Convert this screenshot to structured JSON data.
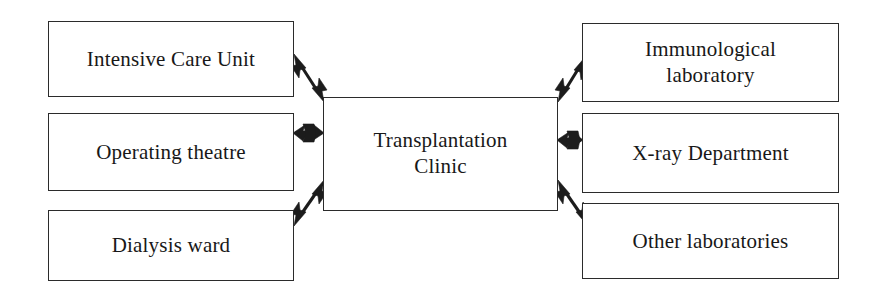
{
  "diagram": {
    "line_color": "#1c1c1c",
    "box_border_color": "#2b2b2b",
    "background_color": "#ffffff",
    "center_node": {
      "id": "transplantation-clinic",
      "label": "Transplantation\nClinic"
    },
    "left_nodes": [
      {
        "id": "intensive-care-unit",
        "label": "Intensive Care Unit"
      },
      {
        "id": "operating-theatre",
        "label": "Operating theatre"
      },
      {
        "id": "dialysis-ward",
        "label": "Dialysis ward"
      }
    ],
    "right_nodes": [
      {
        "id": "immunological-laboratory",
        "label": "Immunological\nlaboratory"
      },
      {
        "id": "x-ray-department",
        "label": "X-ray Department"
      },
      {
        "id": "other-laboratories",
        "label": "Other laboratories"
      }
    ],
    "edges": [
      {
        "id": "edge-icu-clinic",
        "from": "intensive-care-unit",
        "to": "transplantation-clinic",
        "style": "double-arrow",
        "direction": "diagonal-down-right"
      },
      {
        "id": "edge-ot-clinic",
        "from": "operating-theatre",
        "to": "transplantation-clinic",
        "style": "double-arrow",
        "direction": "horizontal"
      },
      {
        "id": "edge-dialysis-clinic",
        "from": "dialysis-ward",
        "to": "transplantation-clinic",
        "style": "double-arrow",
        "direction": "diagonal-up-right"
      },
      {
        "id": "edge-clinic-immuno",
        "from": "transplantation-clinic",
        "to": "immunological-laboratory",
        "style": "double-arrow",
        "direction": "diagonal-up-right"
      },
      {
        "id": "edge-clinic-xray",
        "from": "transplantation-clinic",
        "to": "x-ray-department",
        "style": "double-arrow",
        "direction": "horizontal"
      },
      {
        "id": "edge-clinic-otherlab",
        "from": "transplantation-clinic",
        "to": "other-laboratories",
        "style": "double-arrow",
        "direction": "diagonal-down-right"
      }
    ]
  }
}
